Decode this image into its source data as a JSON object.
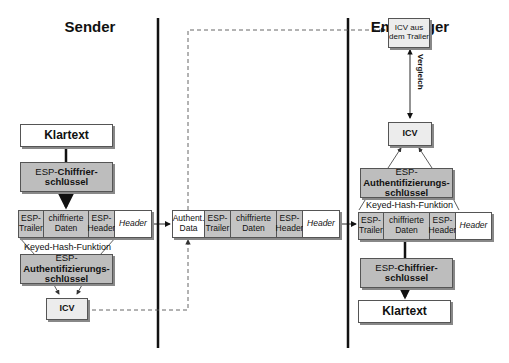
{
  "sender": {
    "title": "Sender",
    "plaintext": "Klartext",
    "cipher_key": {
      "prefix": "ESP-",
      "bold": "Chiffrier-",
      "line2": "schlüssel"
    },
    "packet": [
      {
        "label": "ESP-\nTrailer",
        "style": "g"
      },
      {
        "label": "chiffrierte\nDaten",
        "style": "g"
      },
      {
        "label": "ESP-\nHeader",
        "style": "g"
      },
      {
        "label": "Header",
        "style": "i"
      }
    ],
    "hash_function": "Keyed-Hash-Funktion",
    "auth_key": {
      "prefix": "ESP-",
      "bold": "Authentifizierungs-",
      "line2": "schlüssel"
    },
    "icv": "ICV"
  },
  "transit": {
    "packet": [
      {
        "label": "Authent.\nData",
        "style": "w"
      },
      {
        "label": "ESP-\nTrailer",
        "style": "g"
      },
      {
        "label": "chiffrierte\nDaten",
        "style": "g"
      },
      {
        "label": "ESP-\nHeader",
        "style": "g"
      },
      {
        "label": "Header",
        "style": "i"
      }
    ]
  },
  "receiver": {
    "title": "Empfänger",
    "icv_from_trailer": "ICV aus\ndem Trailer",
    "compare_label": "Vergleich",
    "icv": "ICV",
    "auth_key": {
      "prefix": "ESP-",
      "bold": "Authentifizierungs-",
      "line2": "schlüssel"
    },
    "hash_function": "Keyed-Hash-Funktion",
    "packet": [
      {
        "label": "ESP-\nTrailer",
        "style": "g"
      },
      {
        "label": "chiffrierte\nDaten",
        "style": "g"
      },
      {
        "label": "ESP-\nHeader",
        "style": "g"
      },
      {
        "label": "Header",
        "style": "i"
      }
    ],
    "cipher_key": {
      "prefix": "ESP-",
      "bold": "Chiffrier-",
      "line2": "schlüssel"
    },
    "plaintext": "Klartext"
  },
  "colors": {
    "key_fill": "#bdbdbd",
    "cell_fill": "#c4c4c4",
    "icv_fill": "#ececec",
    "border": "#555555",
    "shadow": "#888888"
  }
}
